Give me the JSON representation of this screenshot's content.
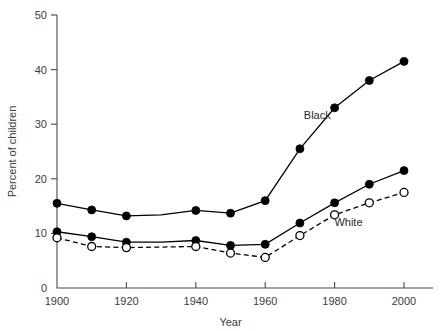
{
  "chart_data": {
    "type": "line",
    "title": "",
    "xlabel": "Year",
    "ylabel": "Percent of children",
    "xlim": [
      1900,
      2000
    ],
    "ylim": [
      0,
      50
    ],
    "xticks": [
      1900,
      1920,
      1940,
      1960,
      1980,
      2000
    ],
    "xtick_labels": [
      "1900",
      "1920",
      "1940",
      "1960",
      "1980",
      "2000"
    ],
    "yticks": [
      0,
      10,
      20,
      30,
      40,
      50
    ],
    "ytick_labels": [
      "0",
      "10",
      "20",
      "30",
      "40",
      "50"
    ],
    "grid": false,
    "legend_position": "inline-annotations",
    "x": [
      1900,
      1910,
      1920,
      1930,
      1940,
      1950,
      1960,
      1970,
      1980,
      1990,
      2000
    ],
    "series": [
      {
        "name": "Black",
        "label": "Black",
        "marker": "filled-circle",
        "linestyle": "solid",
        "color": "#000000",
        "values": [
          15.5,
          14.3,
          13.2,
          13.4,
          14.2,
          13.7,
          16.0,
          25.5,
          33.0,
          38.0,
          41.5
        ]
      },
      {
        "name": "Black-lower",
        "label": "",
        "marker": "filled-circle",
        "linestyle": "solid",
        "color": "#000000",
        "values": [
          10.3,
          9.4,
          8.4,
          8.4,
          8.7,
          7.8,
          8.0,
          11.9,
          15.6,
          19.0,
          21.5
        ]
      },
      {
        "name": "White",
        "label": "White",
        "marker": "open-circle",
        "linestyle": "dashed",
        "color": "#000000",
        "values": [
          9.2,
          7.6,
          7.4,
          7.5,
          7.6,
          6.4,
          5.6,
          9.6,
          13.4,
          15.6,
          17.5
        ]
      }
    ],
    "annotations": [
      {
        "text": "Black",
        "x": 1975,
        "y": 31.0
      },
      {
        "text": "White",
        "x": 1984,
        "y": 11.4
      }
    ]
  }
}
